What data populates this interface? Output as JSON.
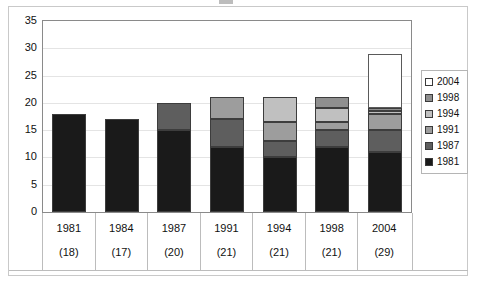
{
  "figure": {
    "background_color": "#ffffff",
    "border_color": "#c9c9c9",
    "plot_border_color": "#8a8a8a",
    "gridline_color": "#e4e4e4"
  },
  "chart_data": {
    "type": "bar",
    "subtype": "stacked-column",
    "title": "",
    "xlabel": "",
    "ylabel": "",
    "ylim": [
      0,
      35
    ],
    "ytick_step": 5,
    "yticks": [
      "0",
      "5",
      "10",
      "15",
      "20",
      "25",
      "30",
      "35"
    ],
    "grid": true,
    "legend_position": "right",
    "categories": [
      "1981",
      "1984",
      "1987",
      "1991",
      "1994",
      "1998",
      "2004"
    ],
    "category_sublabels": [
      "(18)",
      "(17)",
      "(20)",
      "(21)",
      "(21)",
      "(21)",
      "(29)"
    ],
    "totals": [
      18,
      17,
      20,
      21,
      21,
      21,
      29
    ],
    "series": [
      {
        "name": "1981",
        "color": "#1a1a1a",
        "values": [
          18,
          17,
          15,
          12,
          10,
          12,
          11
        ]
      },
      {
        "name": "1987",
        "color": "#5e5e5e",
        "values": [
          0,
          0,
          5,
          5,
          3,
          3,
          4
        ]
      },
      {
        "name": "1991",
        "color": "#9d9d9d",
        "values": [
          0,
          0,
          0,
          4,
          3.5,
          1.5,
          3
        ]
      },
      {
        "name": "1994",
        "color": "#c0c0c0",
        "values": [
          0,
          0,
          0,
          0,
          4.5,
          2.5,
          0.6
        ]
      },
      {
        "name": "1998",
        "color": "#8f8f8f",
        "values": [
          0,
          0,
          0,
          0,
          0,
          2,
          0.4
        ]
      },
      {
        "name": "2004",
        "color": "#ffffff",
        "values": [
          0,
          0,
          0,
          0,
          0,
          0,
          10
        ]
      }
    ],
    "legend_entries": [
      {
        "label": "2004",
        "color": "#ffffff"
      },
      {
        "label": "1998",
        "color": "#8f8f8f"
      },
      {
        "label": "1994",
        "color": "#c0c0c0"
      },
      {
        "label": "1991",
        "color": "#9d9d9d"
      },
      {
        "label": "1987",
        "color": "#5e5e5e"
      },
      {
        "label": "1981",
        "color": "#1a1a1a"
      }
    ]
  }
}
